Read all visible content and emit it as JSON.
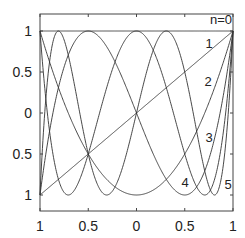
{
  "chart_data": {
    "type": "line",
    "title": "",
    "xlabel": "",
    "ylabel": "",
    "xlim": [
      -1,
      1
    ],
    "ylim": [
      -1.2,
      1.2
    ],
    "grid": false,
    "legend": "inline labels near right edge",
    "x_ticks": [
      -1,
      -0.5,
      0,
      0.5,
      1
    ],
    "x_tick_labels": [
      "1",
      "0.5",
      "0",
      "0.5",
      "1"
    ],
    "y_ticks": [
      1,
      0.5,
      0,
      -0.5,
      -1
    ],
    "y_tick_labels": [
      "1",
      "0.5",
      "0",
      "0.5",
      "1"
    ],
    "series": [
      {
        "name": "n=0",
        "label": "n=0",
        "n": 0,
        "function": "T0(x)=1",
        "label_pos": [
          221,
          24
        ]
      },
      {
        "name": "1",
        "label": "1",
        "n": 1,
        "function": "T1(x)=x",
        "label_pos": [
          209,
          48
        ]
      },
      {
        "name": "2",
        "label": "2",
        "n": 2,
        "function": "T2(x)=2x^2-1",
        "label_pos": [
          208,
          86
        ]
      },
      {
        "name": "3",
        "label": "3",
        "n": 3,
        "function": "T3(x)=4x^3-3x",
        "label_pos": [
          209,
          142
        ]
      },
      {
        "name": "4",
        "label": "4",
        "n": 4,
        "function": "T4(x)=8x^4-8x^2+1",
        "label_pos": [
          185,
          187
        ]
      },
      {
        "name": "5",
        "label": "5",
        "n": 5,
        "function": "T5(x)=16x^5-20x^3+5x",
        "label_pos": [
          228,
          189
        ]
      }
    ],
    "line_color": "#333333"
  }
}
